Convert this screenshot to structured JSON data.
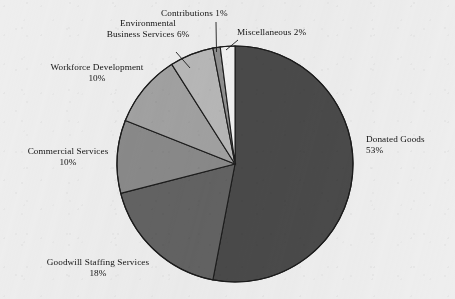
{
  "chart_data": {
    "type": "pie",
    "title": "",
    "subtitle": "",
    "xlabel": "",
    "ylabel": "",
    "legend_position": "none",
    "grid": false,
    "value_unit": "%",
    "categories": [
      "Donated Goods",
      "Goodwill Staffing Services",
      "Commercial Services",
      "Workforce Development",
      "Environmental Business Services",
      "Contributions",
      "Miscellaneous"
    ],
    "values": [
      53,
      18,
      10,
      10,
      6,
      1,
      2
    ],
    "colors": [
      "#4a4a4a",
      "#636363",
      "#8a8a8a",
      "#a2a2a2",
      "#b8b8b8",
      "#909090",
      "#f2f2f2"
    ],
    "slices": [
      {
        "label": "Donated Goods",
        "value": 53,
        "value_text": "53%",
        "color": "#4a4a4a"
      },
      {
        "label": "Goodwill Staffing Services",
        "value": 18,
        "value_text": "18%",
        "color": "#636363"
      },
      {
        "label": "Commercial Services",
        "value": 10,
        "value_text": "10%",
        "color": "#8a8a8a"
      },
      {
        "label": "Workforce Development",
        "value": 10,
        "value_text": "10%",
        "color": "#a2a2a2"
      },
      {
        "label": "Environmental Business Services",
        "value": 6,
        "value_text": "6%",
        "color": "#b8b8b8"
      },
      {
        "label": "Contributions",
        "value": 1,
        "value_text": "1%",
        "color": "#909090"
      },
      {
        "label": "Miscellaneous",
        "value": 2,
        "value_text": "2%",
        "color": "#f2f2f2"
      }
    ]
  },
  "labels": {
    "contributions": {
      "name": "Contributions",
      "value": "1%"
    },
    "miscellaneous": {
      "name": "Miscellaneous",
      "value": "2%"
    },
    "environmental": {
      "line1": "Environmental",
      "line2": "Business Services",
      "value": "6%"
    },
    "workforce": {
      "name": "Workforce Development",
      "value": "10%"
    },
    "commercial": {
      "name": "Commercial Services",
      "value": "10%"
    },
    "goodwill": {
      "name": "Goodwill Staffing Services",
      "value": "18%"
    },
    "donated": {
      "name": "Donated Goods",
      "value": "53%"
    }
  },
  "style": {
    "background": "#efefef",
    "outline": "#1c1c1c",
    "text": "#141414"
  }
}
